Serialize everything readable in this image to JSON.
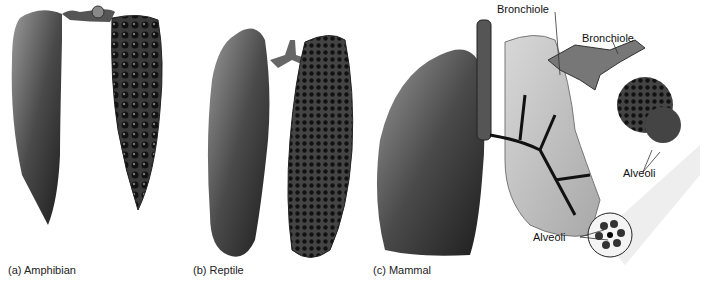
{
  "figure": {
    "panels": [
      {
        "id": "a",
        "caption": "(a) Amphibian"
      },
      {
        "id": "b",
        "caption": "(b) Reptile"
      },
      {
        "id": "c",
        "caption": "(c) Mammal"
      }
    ],
    "labels": {
      "bronchiole_1": "Bronchiole",
      "bronchiole_2": "Bronchiole",
      "alveoli_1": "Alveoli",
      "alveoli_2": "Alveoli"
    }
  }
}
